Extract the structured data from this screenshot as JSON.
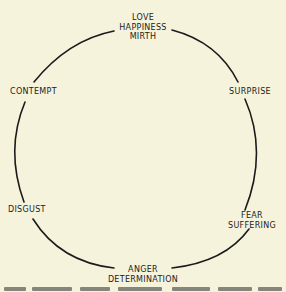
{
  "diagram": {
    "type": "circular emotion diagram",
    "line_color": "#1b1b1b",
    "background": "#f6f3dc",
    "labels": [
      {
        "id": "top",
        "lines": [
          "LOVE",
          "HAPPINESS",
          "MIRTH"
        ]
      },
      {
        "id": "upper-right",
        "lines": [
          "SURPRISE"
        ]
      },
      {
        "id": "lower-right",
        "lines": [
          "FEAR",
          "SUFFERING"
        ]
      },
      {
        "id": "bottom",
        "lines": [
          "ANGER",
          "DETERMINATION"
        ]
      },
      {
        "id": "lower-left",
        "lines": [
          "DISGUST"
        ]
      },
      {
        "id": "upper-left",
        "lines": [
          "CONTEMPT"
        ]
      }
    ]
  },
  "caption": {
    "visible": "partially cut off at bottom edge (illegible)"
  }
}
